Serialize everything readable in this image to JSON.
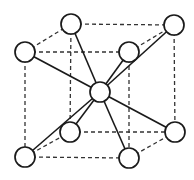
{
  "diagram": {
    "atom_radius": 10,
    "colors": {
      "background": "#ffffff",
      "line": "#1a1a1a",
      "dashed_edge": "#333333",
      "atom_fill": "#ffffff"
    },
    "atoms": [
      {
        "id": "back-top-left",
        "x": 71,
        "y": 24
      },
      {
        "id": "back-top-right",
        "x": 174,
        "y": 25
      },
      {
        "id": "front-top-left",
        "x": 25,
        "y": 52
      },
      {
        "id": "front-top-right",
        "x": 129,
        "y": 52
      },
      {
        "id": "center",
        "x": 100,
        "y": 92
      },
      {
        "id": "back-bottom-left",
        "x": 70,
        "y": 132
      },
      {
        "id": "back-bottom-right",
        "x": 175,
        "y": 132
      },
      {
        "id": "front-bottom-left",
        "x": 25,
        "y": 157
      },
      {
        "id": "front-bottom-right",
        "x": 129,
        "y": 158
      }
    ],
    "cube_edges": [
      [
        "front-top-left",
        "front-top-right"
      ],
      [
        "back-top-left",
        "back-top-right"
      ],
      [
        "front-top-left",
        "back-top-left"
      ],
      [
        "front-top-right",
        "back-top-right"
      ],
      [
        "front-bottom-left",
        "front-bottom-right"
      ],
      [
        "back-bottom-left",
        "back-bottom-right"
      ],
      [
        "front-bottom-left",
        "back-bottom-left"
      ],
      [
        "front-bottom-right",
        "back-bottom-right"
      ],
      [
        "front-top-left",
        "front-bottom-left"
      ],
      [
        "front-top-right",
        "front-bottom-right"
      ],
      [
        "back-top-left",
        "back-bottom-left"
      ],
      [
        "back-top-right",
        "back-bottom-right"
      ]
    ],
    "bonds": [
      [
        "center",
        "front-top-left"
      ],
      [
        "center",
        "back-top-left"
      ],
      [
        "center",
        "front-top-right"
      ],
      [
        "center",
        "back-top-right"
      ],
      [
        "center",
        "back-bottom-left"
      ],
      [
        "center",
        "front-bottom-left"
      ],
      [
        "center",
        "front-bottom-right"
      ],
      [
        "center",
        "back-bottom-right"
      ]
    ]
  }
}
